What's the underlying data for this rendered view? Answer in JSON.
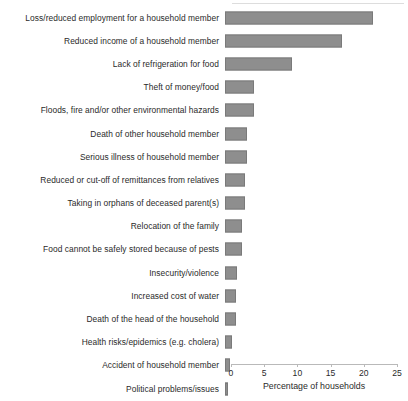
{
  "chart_data": {
    "type": "bar",
    "orientation": "horizontal",
    "title": "",
    "subtitle": "",
    "xlabel": "Percentage of households",
    "ylabel": "",
    "xlim": [
      0,
      25
    ],
    "xticks": [
      0,
      5,
      10,
      15,
      20,
      25
    ],
    "xtick_labels": [
      "0",
      "5",
      "10",
      "15",
      "20",
      "25"
    ],
    "grid": false,
    "legend": false,
    "bar_color": "#8e8e8e",
    "categories": [
      "Loss/reduced employment for a household member",
      "Reduced income of a household member",
      "Lack of refrigeration for food",
      "Theft of money/food",
      "Floods, fire and/or other environmental hazards",
      "Death of other household member",
      "Serious illness of household member",
      "Reduced or cut-off of remittances from relatives",
      "Taking in orphans of deceased parent(s)",
      "Relocation of the family",
      "Food cannot be safely stored because of pests",
      "Insecurity/violence",
      "Increased cost of water",
      "Death of the head of the household",
      "Health risks/epidemics (e.g. cholera)",
      "Accident of household member",
      "Political problems/issues"
    ],
    "values": [
      22.3,
      17.6,
      10.1,
      4.4,
      4.4,
      3.3,
      3.3,
      3.0,
      3.0,
      2.6,
      2.5,
      1.8,
      1.7,
      1.6,
      1.0,
      0.8,
      0.4
    ]
  }
}
